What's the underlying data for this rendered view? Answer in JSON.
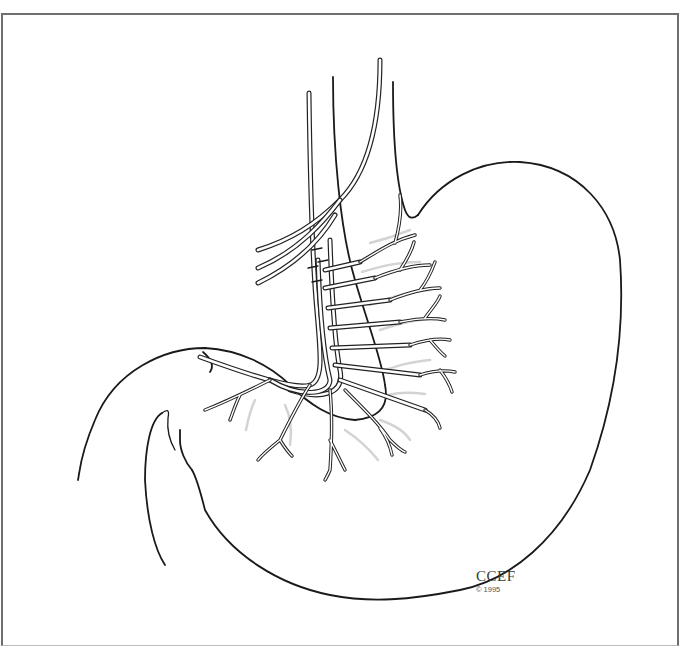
{
  "figure": {
    "credit": {
      "label": "CCEF",
      "copyright": "© 1995"
    },
    "colors": {
      "line": "#1a1a1a",
      "frame": "#6e6e6e",
      "shading": "#c8c8c8",
      "background": "#ffffff"
    }
  }
}
